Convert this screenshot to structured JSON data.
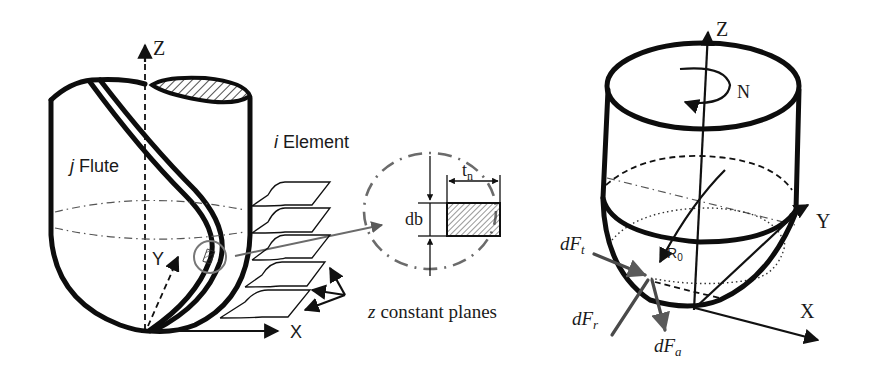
{
  "figure": {
    "left_panel": {
      "name": "ball-end-mill-flute-discretization",
      "labels": {
        "z_axis": "Z",
        "y_axis": "Y",
        "x_axis": "X",
        "flute": "Flute",
        "flute_index": "j",
        "element": "Element",
        "element_index": "i",
        "planes_var": "z",
        "planes": "constant planes"
      }
    },
    "detail_inset": {
      "name": "chip-element-cross-section",
      "labels": {
        "height": "db",
        "thickness_base": "t",
        "thickness_sub": "n"
      }
    },
    "right_panel": {
      "name": "ball-end-mill-force-components",
      "labels": {
        "z_axis": "Z",
        "rotation": "N",
        "y_axis": "Y",
        "x_axis": "X",
        "radius_base": "R",
        "radius_sub": "0",
        "tangential_force": "dF",
        "tangential_sub": "t",
        "radial_force": "dF",
        "radial_sub": "r",
        "axial_force": "dF",
        "axial_sub": "a"
      }
    },
    "colors": {
      "outline": "#0d0d0d",
      "leader": "#6b6b6b",
      "force_arrow": "#4a4a4a",
      "background": "#ffffff"
    }
  }
}
